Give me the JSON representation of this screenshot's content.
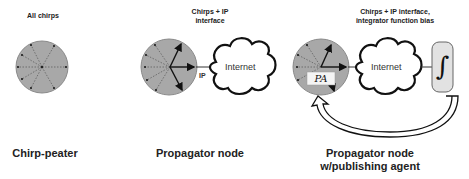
{
  "panels": [
    {
      "id": "chirp-peater",
      "top_label": "All chirps",
      "bottom_label": "Chirp-peater"
    },
    {
      "id": "propagator-node",
      "top_label_line1": "Chirps + IP",
      "top_label_line2": "interface",
      "link_label": "IP",
      "cloud_label": "Internet",
      "bottom_label": "Propagator node"
    },
    {
      "id": "propagator-node-publishing-agent",
      "top_label_line1": "Chirps + IP interface,",
      "top_label_line2": "integrator function bias",
      "cloud_label": "Internet",
      "agent_label": "PA",
      "integrator_symbol": "∫",
      "bottom_label_line1": "Propagator node",
      "bottom_label_line2": "w/publishing agent"
    }
  ],
  "colors": {
    "node_fill": "#a8a8a8",
    "node_stroke": "#8a8a8a",
    "line": "#111111",
    "integrator_fill": "#e2e2e2",
    "pa_box_fill": "#f4f4f4"
  }
}
